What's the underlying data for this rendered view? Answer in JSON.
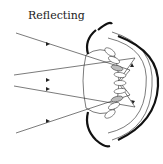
{
  "diagram": {
    "title": "Reflecting",
    "type": "optical-diagram",
    "elements": [
      "incoming light rays",
      "lens",
      "reflective mirror cells",
      "retina",
      "outer shell"
    ],
    "colors": {
      "stroke": "#222222",
      "background": "#ffffff",
      "cell_fill": "#bbbbbb"
    }
  }
}
